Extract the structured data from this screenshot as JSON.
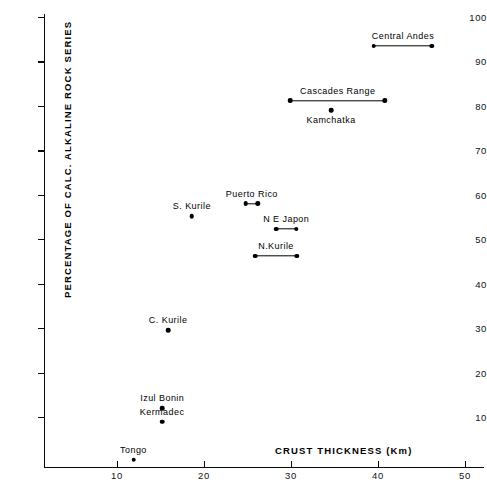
{
  "chart_data": {
    "type": "scatter",
    "title": "",
    "xlabel": "CRUST THICKNESS (Km)",
    "ylabel": "PERCENTAGE OF CALC. ALKALINE ROCK SERIES",
    "xlim": [
      0,
      50
    ],
    "ylim": [
      0,
      100
    ],
    "xticks": [
      10,
      20,
      30,
      40,
      50
    ],
    "yticks": [
      10,
      20,
      30,
      40,
      50,
      60,
      70,
      80,
      90,
      100
    ],
    "xtick_labels": [
      "10",
      "20",
      "30",
      "40",
      "50"
    ],
    "ytick_labels": [
      "10",
      "20",
      "30",
      "40",
      "50",
      "60",
      "70",
      "80",
      "90",
      "100"
    ],
    "grid": false,
    "legend": "none",
    "marker_color": "#000000",
    "points": [
      {
        "name": "Central Andes",
        "y": 93.5,
        "x_min": 39.5,
        "x_max": 46.2,
        "has_range": true,
        "label": "Central Andes",
        "label_side": "above"
      },
      {
        "name": "Cascades Range",
        "y": 81.2,
        "x_min": 29.9,
        "x_max": 40.8,
        "has_range": true,
        "label": "Cascades Range",
        "label_side": "above"
      },
      {
        "name": "Kamchatka",
        "y": 79.0,
        "x": 34.6,
        "has_range": false,
        "label": "Kamchatka",
        "label_side": "below"
      },
      {
        "name": "Puerto Rico",
        "y": 58.0,
        "x_min": 24.8,
        "x_max": 26.2,
        "has_range": true,
        "label": "Puerto Rico",
        "label_side": "above"
      },
      {
        "name": "S. Kurile",
        "y": 55.2,
        "x": 18.6,
        "has_range": false,
        "label": "S. Kurile",
        "label_side": "above"
      },
      {
        "name": "N. E. Japon",
        "y": 52.3,
        "x_min": 28.3,
        "x_max": 30.6,
        "has_range": true,
        "label": "N  E   Japon",
        "label_side": "above"
      },
      {
        "name": "N. Kurile",
        "y": 46.2,
        "x_min": 25.9,
        "x_max": 30.7,
        "has_range": true,
        "label": "N.Kurile",
        "label_side": "above"
      },
      {
        "name": "C. Kurile",
        "y": 29.5,
        "x": 15.9,
        "has_range": false,
        "label": "C. Kurile",
        "label_side": "above"
      },
      {
        "name": "Izul Bonin",
        "y": 12.0,
        "x": 15.2,
        "has_range": false,
        "label": "Izul Bonin",
        "label_side": "above"
      },
      {
        "name": "Kermadec",
        "y": 8.9,
        "x": 15.2,
        "has_range": false,
        "label": "Kermadec",
        "label_side": "above"
      },
      {
        "name": "Tongo",
        "y": 0.4,
        "x": 11.9,
        "has_range": false,
        "label": "Tongo",
        "label_side": "above"
      }
    ]
  }
}
